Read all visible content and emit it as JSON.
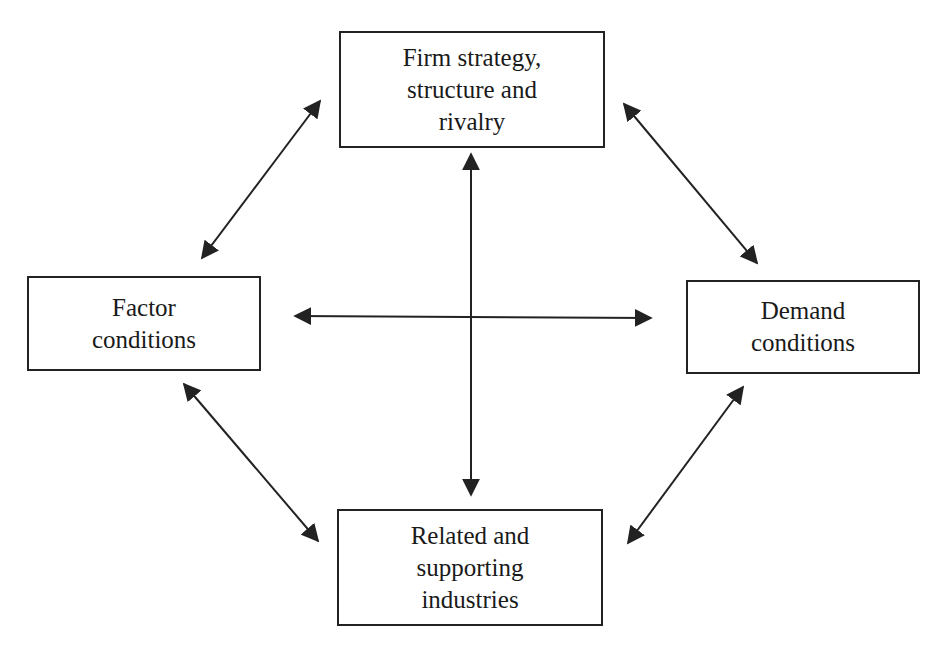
{
  "diagram": {
    "type": "porter-diamond",
    "nodes": {
      "top": {
        "lines": [
          "Firm strategy,",
          "structure and",
          "rivalry"
        ]
      },
      "left": {
        "lines": [
          "Factor",
          "conditions"
        ]
      },
      "right": {
        "lines": [
          "Demand",
          "conditions"
        ]
      },
      "bottom": {
        "lines": [
          "Related and",
          "supporting",
          "industries"
        ]
      }
    },
    "edges": [
      {
        "from": "left",
        "to": "top",
        "bidirectional": true
      },
      {
        "from": "top",
        "to": "right",
        "bidirectional": true
      },
      {
        "from": "left",
        "to": "bottom",
        "bidirectional": true
      },
      {
        "from": "bottom",
        "to": "right",
        "bidirectional": true
      },
      {
        "from": "left",
        "to": "right",
        "bidirectional": true
      },
      {
        "from": "top",
        "to": "bottom",
        "bidirectional": true
      }
    ],
    "colors": {
      "line": "#222222",
      "background": "#ffffff"
    }
  }
}
